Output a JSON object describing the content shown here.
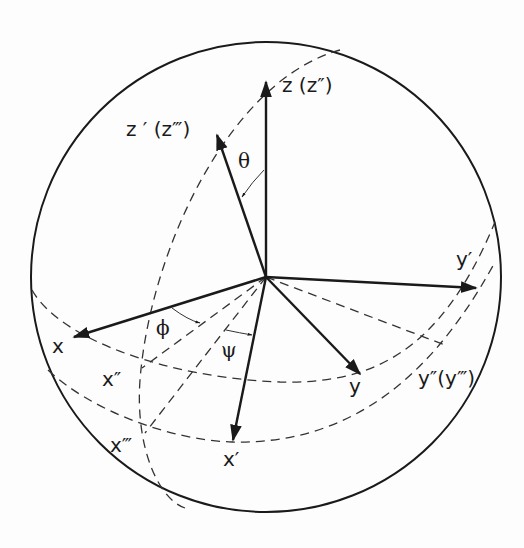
{
  "figure": {
    "colors": {
      "ink": "#1a1a1a",
      "background": "#fdfdfd"
    }
  },
  "labels": {
    "z": "z (z″)",
    "z_prime": "z ′ (z‴)",
    "y_prime": "y′",
    "x": "x",
    "x_double": "x″",
    "x_triple": "x‴",
    "x_prime": "x′",
    "y": "y",
    "y_double": "y″(y‴)"
  },
  "angles": {
    "theta": "θ",
    "phi": "ϕ",
    "psi": "ψ"
  }
}
